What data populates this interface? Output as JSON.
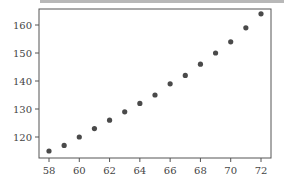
{
  "chart_data": {
    "type": "scatter",
    "title": "",
    "xlabel": "",
    "ylabel": "",
    "x": [
      58,
      59,
      60,
      61,
      62,
      63,
      64,
      65,
      66,
      67,
      68,
      69,
      70,
      71,
      72
    ],
    "y": [
      115,
      117,
      120,
      123,
      126,
      129,
      132,
      135,
      139,
      142,
      146,
      150,
      154,
      159,
      164
    ],
    "xlim": [
      57.3,
      72.6
    ],
    "ylim": [
      112,
      166
    ],
    "xticks": [
      58,
      60,
      62,
      64,
      66,
      68,
      70,
      72
    ],
    "yticks": [
      120,
      130,
      140,
      150,
      160
    ],
    "grid": false,
    "legend": null,
    "marker_color": "#4a4a4a",
    "axis_color": "#555555"
  }
}
